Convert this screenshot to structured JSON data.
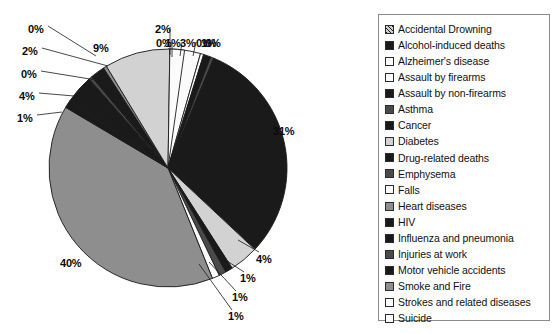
{
  "chart_data": {
    "type": "pie",
    "title": "",
    "legend_position": "right",
    "units": "percent",
    "categories": [
      "Accidental Drowning",
      "Alcohol-induced deaths",
      "Alzheimer's disease",
      "Assault by firearms",
      "Assault by non-firearms",
      "Asthma",
      "Cancer",
      "Diabetes",
      "Drug-related deaths",
      "Emphysema",
      "Falls",
      "Heart diseases",
      "HIV",
      "Influenza and pneumonia",
      "Injuries at work",
      "Motor vehicle accidents",
      "Smoke and Fire",
      "Strokes and related diseases",
      "Suicide"
    ],
    "values": [
      0,
      1,
      3,
      0,
      1,
      0,
      31,
      4,
      1,
      1,
      1,
      40,
      1,
      4,
      0,
      2,
      0,
      9,
      2
    ],
    "labels": [
      "0%",
      "1%",
      "3%",
      "0%",
      "1%",
      "0%",
      "31%",
      "4%",
      "1%",
      "1%",
      "1%",
      "40%",
      "1%",
      "4%",
      "0%",
      "2%",
      "0%",
      "9%",
      "2%"
    ],
    "slice_fills": [
      "dark-hatch",
      "black",
      "white",
      "white",
      "black",
      "dark-gray",
      "black",
      "light-gray",
      "black",
      "dark-gray",
      "white",
      "mid-gray",
      "black",
      "black",
      "dark-gray",
      "black",
      "mid-gray",
      "light-gray",
      "white"
    ]
  },
  "pie": {
    "labels": [
      {
        "text": "0%",
        "x": 28,
        "y": 23
      },
      {
        "text": "2%",
        "x": 22,
        "y": 45
      },
      {
        "text": "0%",
        "x": 21,
        "y": 68
      },
      {
        "text": "4%",
        "x": 19,
        "y": 90
      },
      {
        "text": "1%",
        "x": 17,
        "y": 112
      },
      {
        "text": "9%",
        "x": 93,
        "y": 42
      },
      {
        "text": "2%",
        "x": 155,
        "y": 23
      },
      {
        "text": "0%",
        "x": 156,
        "y": 37
      },
      {
        "text": "1%",
        "x": 165,
        "y": 37
      },
      {
        "text": "3%",
        "x": 180,
        "y": 37
      },
      {
        "text": "0%",
        "x": 196,
        "y": 37
      },
      {
        "text": "1%",
        "x": 201,
        "y": 37
      },
      {
        "text": "0%",
        "x": 205,
        "y": 37
      },
      {
        "text": "31%",
        "x": 273,
        "y": 125
      },
      {
        "text": "4%",
        "x": 256,
        "y": 253
      },
      {
        "text": "1%",
        "x": 240,
        "y": 272
      },
      {
        "text": "1%",
        "x": 232,
        "y": 291
      },
      {
        "text": "1%",
        "x": 228,
        "y": 310
      },
      {
        "text": "40%",
        "x": 60,
        "y": 257
      }
    ]
  },
  "legend": {
    "items": [
      {
        "label": "Accidental Drowning",
        "fill": "dark-hatch"
      },
      {
        "label": "Alcohol-induced deaths",
        "fill": "black"
      },
      {
        "label": "Alzheimer's disease",
        "fill": "white"
      },
      {
        "label": "Assault by firearms",
        "fill": "white"
      },
      {
        "label": "Assault by non-firearms",
        "fill": "black"
      },
      {
        "label": "Asthma",
        "fill": "dark-gray"
      },
      {
        "label": "Cancer",
        "fill": "black"
      },
      {
        "label": "Diabetes",
        "fill": "light-gray"
      },
      {
        "label": "Drug-related deaths",
        "fill": "black"
      },
      {
        "label": "Emphysema",
        "fill": "dark-gray"
      },
      {
        "label": "Falls",
        "fill": "white"
      },
      {
        "label": "Heart diseases",
        "fill": "mid-gray"
      },
      {
        "label": "HIV",
        "fill": "black"
      },
      {
        "label": "Influenza and pneumonia",
        "fill": "black"
      },
      {
        "label": "Injuries at work",
        "fill": "dark-gray"
      },
      {
        "label": "Motor vehicle accidents",
        "fill": "black"
      },
      {
        "label": "Smoke and Fire",
        "fill": "mid-gray"
      },
      {
        "label": "Strokes and related diseases",
        "fill": "white"
      },
      {
        "label": "Suicide",
        "fill": "white"
      }
    ]
  },
  "colors": {
    "black": "#1a1a1a",
    "dark-gray": "#4a4a4a",
    "mid-gray": "#8e8e8e",
    "light-gray": "#d2d2d2",
    "white": "#fbfbfb",
    "dark-hatch": "#6b6b6b",
    "outline": "#1a1a1a",
    "legend-border": "#8a8a8a",
    "text": "#111111"
  }
}
